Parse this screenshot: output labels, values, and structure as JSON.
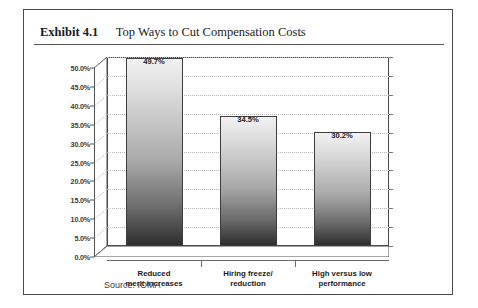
{
  "exhibit": {
    "number_label": "Exhibit 4.1",
    "title": "Top Ways to Cut Compensation Costs"
  },
  "source_note": "Source: IOMA",
  "colors": {
    "frame_border": "#4a4a4a",
    "text": "#1c1c1c",
    "gridline": "#b9b9b9",
    "bar_top": "#f2f2f2",
    "bar_bottom": "#2e2e2e",
    "axis": "#555555"
  },
  "chart_data": {
    "type": "bar",
    "title": "Top Ways to Cut Compensation Costs",
    "xlabel": "",
    "ylabel": "",
    "categories": [
      "Reduced merit increases",
      "Hiring freeze/ reduction",
      "High versus low performance"
    ],
    "category_lines": [
      [
        "Reduced",
        "merit increases"
      ],
      [
        "Hiring freeze/",
        "reduction"
      ],
      [
        "High versus low",
        "performance"
      ]
    ],
    "values": [
      49.7,
      34.5,
      30.2
    ],
    "value_labels": [
      "49.7%",
      "34.5%",
      "30.2%"
    ],
    "ylim": [
      0,
      50
    ],
    "ytick_step": 5,
    "ytick_labels": [
      "0.0%",
      "5.0%",
      "10.0%",
      "15.0%",
      "20.0%",
      "25.0%",
      "30.0%",
      "35.0%",
      "40.0%",
      "45.0%",
      "50.0%"
    ],
    "grid": true,
    "legend": "none",
    "style": "3d-column"
  }
}
